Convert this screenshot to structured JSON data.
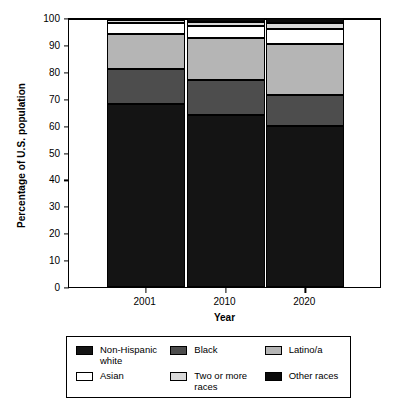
{
  "chart_data": {
    "type": "bar",
    "stacked": true,
    "stacked_mode": "percent",
    "title": "",
    "xlabel": "Year",
    "ylabel": "Percentage of U.S. population",
    "categories": [
      "2001",
      "2010",
      "2020"
    ],
    "ylim": [
      0,
      100
    ],
    "yticks": [
      0,
      10,
      20,
      30,
      40,
      50,
      60,
      70,
      80,
      90,
      100
    ],
    "grid": false,
    "legend_position": "below",
    "series": [
      {
        "name": "Non-Hispanic white",
        "values": [
          68.0,
          64.0,
          60.0
        ],
        "color": "#141414"
      },
      {
        "name": "Black",
        "values": [
          13.0,
          13.0,
          11.5
        ],
        "color": "#4d4d4d"
      },
      {
        "name": "Latino/a",
        "values": [
          13.0,
          15.5,
          19.0
        ],
        "color": "#b5b5b5"
      },
      {
        "name": "Asian",
        "values": [
          4.0,
          4.5,
          5.5
        ],
        "color": "#ffffff"
      },
      {
        "name": "Two or more races",
        "values": [
          1.3,
          1.5,
          2.0
        ],
        "color": "#d9d9d9"
      },
      {
        "name": "Other races",
        "values": [
          0.7,
          1.5,
          2.0
        ],
        "color": "#0a0a0a"
      }
    ]
  },
  "axis": {
    "y_title": "Percentage of U.S. population",
    "x_title": "Year",
    "y_ticks": [
      "100",
      "90",
      "80",
      "70",
      "60",
      "50",
      "40",
      "30",
      "20",
      "10",
      "0"
    ],
    "x_ticks": [
      "2001",
      "2010",
      "2020"
    ]
  },
  "legend": {
    "entries": [
      {
        "label": "Non-Hispanic\nwhite",
        "color": "#141414"
      },
      {
        "label": "Black",
        "color": "#4d4d4d"
      },
      {
        "label": "Latino/a",
        "color": "#b5b5b5"
      },
      {
        "label": "Asian",
        "color": "#ffffff"
      },
      {
        "label": "Two or more\nraces",
        "color": "#d9d9d9"
      },
      {
        "label": "Other races",
        "color": "#0a0a0a"
      }
    ]
  }
}
